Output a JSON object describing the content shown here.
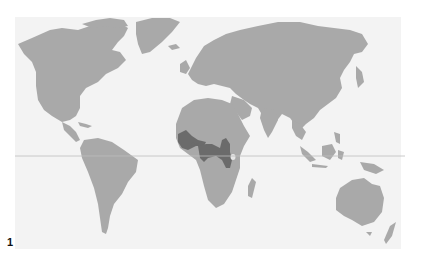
{
  "figure": {
    "label": "1"
  },
  "map": {
    "type": "world-map",
    "projection": "equirectangular-like",
    "background_color": "#f3f3f3",
    "land_color": "#a9a9a9",
    "highlight_color": "#6b6b6b",
    "equator_line_color": "#bdbdbd",
    "highlighted_region": "West and Central Africa (Gulf of Guinea coast to Congo basin)",
    "features": [
      "equator-line"
    ]
  }
}
